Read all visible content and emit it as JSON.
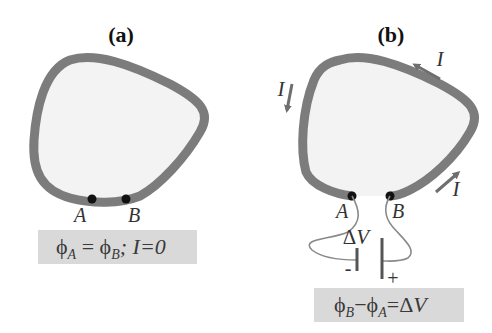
{
  "colors": {
    "background": "#ffffff",
    "wire": "#7c7c7c",
    "loop_fill": "#f3f3f3",
    "equation_box": "#d9d9d9",
    "contact_dot": "#111111",
    "lead_wire": "#8a8a8a",
    "arrow": "#6f6f6f",
    "text": "#333333"
  },
  "panels": [
    {
      "id": "a",
      "label": "(a)",
      "points": [
        {
          "name": "A",
          "label": "A"
        },
        {
          "name": "B",
          "label": "B"
        }
      ],
      "equation": {
        "phi_a": "ϕ",
        "sub_a": "A",
        "equals": " = ",
        "phi_b": "ϕ",
        "sub_b": "B",
        "rest": "; I=0",
        "full_text": "ϕA = ϕB; I=0"
      }
    },
    {
      "id": "b",
      "label": "(b)",
      "points": [
        {
          "name": "A",
          "label": "A"
        },
        {
          "name": "B",
          "label": "B"
        }
      ],
      "currents": [
        {
          "label": "I",
          "position": "left",
          "direction": "down"
        },
        {
          "label": "I",
          "position": "top-right",
          "direction": "up-left"
        },
        {
          "label": "I",
          "position": "bottom-right",
          "direction": "up-right"
        }
      ],
      "battery": {
        "voltage_label_delta": "Δ",
        "voltage_label_v": "V",
        "negative_sign": "-",
        "positive_sign": "+"
      },
      "equation": {
        "phi_b": "ϕ",
        "sub_b": "B",
        "minus": "−",
        "phi_a": "ϕ",
        "sub_a": "A",
        "equals": "=",
        "delta": "Δ",
        "v": "V",
        "full_text": "ϕB − ϕA = ΔV"
      }
    }
  ]
}
